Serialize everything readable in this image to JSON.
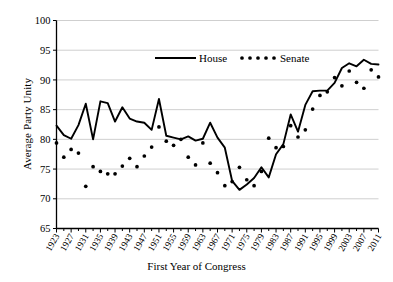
{
  "chart_data": {
    "type": "line",
    "title": "",
    "xlabel": "First Year of Congress",
    "ylabel": "Average Party Unity",
    "ylim": [
      65,
      100
    ],
    "ytick_values": [
      65,
      70,
      75,
      80,
      85,
      90,
      95,
      100
    ],
    "ytick_labels": [
      "65",
      "70",
      "75",
      "80",
      "85",
      "90",
      "95",
      "100"
    ],
    "xlim": [
      1923,
      2011
    ],
    "xtick_labels": [
      "1923",
      "1927",
      "1931",
      "1935",
      "1939",
      "1943",
      "1947",
      "1951",
      "1955",
      "1959",
      "1963",
      "1967",
      "1971",
      "1975",
      "1979",
      "1983",
      "1987",
      "1991",
      "1995",
      "1999",
      "2003",
      "2007",
      "2011"
    ],
    "xtick_step": 4,
    "minor_tick_step": 2,
    "grid": "horizontal",
    "legend_position": "top-center",
    "x": [
      1923,
      1925,
      1927,
      1929,
      1931,
      1933,
      1935,
      1937,
      1939,
      1941,
      1943,
      1945,
      1947,
      1949,
      1951,
      1953,
      1955,
      1957,
      1959,
      1961,
      1963,
      1965,
      1967,
      1969,
      1971,
      1973,
      1975,
      1977,
      1979,
      1981,
      1983,
      1985,
      1987,
      1989,
      1991,
      1993,
      1995,
      1997,
      1999,
      2001,
      2003,
      2005,
      2007,
      2009,
      2011
    ],
    "series": [
      {
        "name": "House",
        "style": "solid",
        "color": "#000000",
        "values": [
          82.3,
          80.7,
          80.1,
          82.4,
          86.0,
          80.0,
          86.4,
          86.1,
          83.0,
          85.4,
          83.5,
          83.0,
          82.8,
          81.6,
          86.8,
          80.6,
          80.3,
          80.0,
          80.5,
          79.8,
          80.1,
          82.8,
          80.3,
          78.6,
          73.0,
          71.5,
          72.4,
          73.5,
          75.3,
          73.6,
          77.5,
          79.2,
          84.2,
          81.3,
          85.8,
          88.1,
          88.2,
          88.2,
          89.5,
          92.0,
          92.8,
          92.3,
          93.4,
          92.7,
          92.6
        ]
      },
      {
        "name": "Senate",
        "style": "dotted",
        "color": "#000000",
        "values": [
          79.4,
          77.0,
          78.3,
          77.7,
          72.1,
          75.4,
          74.6,
          74.2,
          74.2,
          75.5,
          76.8,
          75.4,
          77.2,
          78.7,
          82.1,
          79.7,
          79.0,
          80.0,
          77.0,
          75.7,
          79.4,
          76.0,
          74.4,
          72.2,
          72.9,
          75.3,
          73.2,
          72.2,
          74.6,
          80.2,
          78.6,
          78.8,
          82.3,
          80.4,
          81.6,
          85.1,
          87.4,
          88.0,
          90.4,
          89.0,
          91.5,
          89.6,
          88.6,
          91.7,
          90.5
        ]
      }
    ]
  },
  "legend": {
    "house_label": "House",
    "senate_label": "Senate"
  }
}
